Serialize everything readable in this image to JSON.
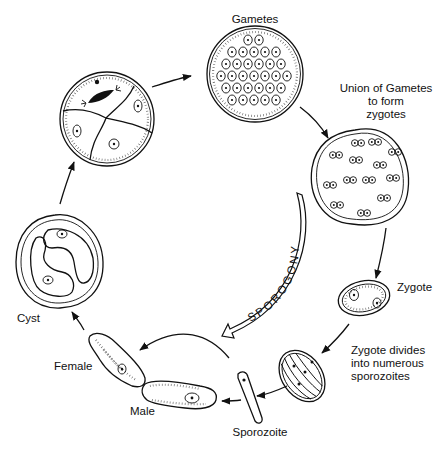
{
  "diagram": {
    "type": "life-cycle",
    "stages": [
      {
        "id": "gametes",
        "label": "Gametes"
      },
      {
        "id": "zygotes",
        "label": "Union of Gametes to form zygotes"
      },
      {
        "id": "zygote",
        "label": "Zygote"
      },
      {
        "id": "sporozoites",
        "label": "Zygote divides into numerous sporozoites"
      },
      {
        "id": "sporozoite",
        "label": "Sporozoite"
      },
      {
        "id": "male",
        "label": "Male"
      },
      {
        "id": "female",
        "label": "Female"
      },
      {
        "id": "cyst",
        "label": "Cyst"
      },
      {
        "id": "dividing-cyst",
        "label": ""
      }
    ],
    "labels": {
      "gametes": "Gametes",
      "union_line1": "Union of Gametes",
      "union_line2": "to form",
      "union_line3": "zygotes",
      "zygote": "Zygote",
      "divides_line1": "Zygote divides",
      "divides_line2": "into numerous",
      "divides_line3": "sporozoites",
      "sporozoite": "Sporozoite",
      "male": "Male",
      "female": "Female",
      "cyst": "Cyst",
      "process": "SPOROGONY"
    },
    "flow": [
      "dividing-cyst",
      "gametes",
      "zygotes",
      "zygote",
      "sporozoites",
      "sporozoite",
      "male",
      "female",
      "cyst",
      "dividing-cyst"
    ]
  }
}
